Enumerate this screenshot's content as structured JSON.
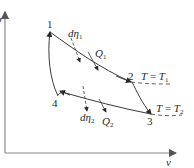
{
  "diagram": {
    "type": "p-v thermodynamic cycle",
    "axes": {
      "y_label": "p",
      "x_label": "v"
    },
    "points": [
      {
        "id": "1",
        "label": "1"
      },
      {
        "id": "2",
        "label": "2"
      },
      {
        "id": "3",
        "label": "3"
      },
      {
        "id": "4",
        "label": "4"
      }
    ],
    "annotations": {
      "d_eta_1": {
        "base": "dη",
        "sub": "1"
      },
      "q_1": {
        "base": "Q",
        "sub": "1"
      },
      "d_eta_2": {
        "base": "dη",
        "sub": "2"
      },
      "q_2": {
        "base": "Q",
        "sub": "2"
      },
      "isotherm_1": {
        "lhs": "T",
        "eq": " = ",
        "rhs": "T",
        "sub": "1"
      },
      "isotherm_2": {
        "lhs": "T",
        "eq": " = ",
        "rhs": "T",
        "sub": "2"
      }
    },
    "colors": {
      "line": "#3a3a3a",
      "axis": "#7a7a7a",
      "text": "#2a2a2a"
    }
  }
}
